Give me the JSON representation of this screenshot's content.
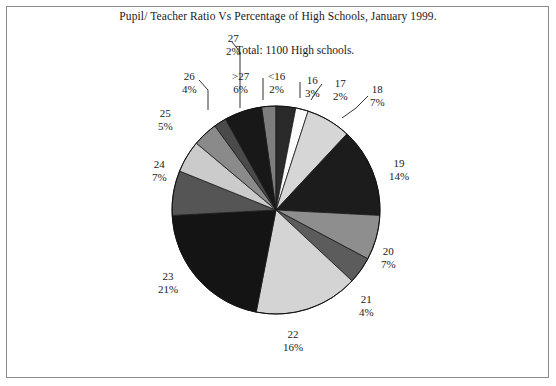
{
  "chart_data": {
    "type": "pie",
    "title": "Pupil/ Teacher Ratio Vs Percentage of High Schools, January 1999.",
    "subtitle": "Total: 1100 High schools.",
    "xlabel": "",
    "ylabel": "",
    "legend": "none",
    "grid": false,
    "total_label": "1100 High schools",
    "categories": [
      "<16",
      "16",
      "17",
      "18",
      "19",
      "20",
      "21",
      "22",
      "23",
      "24",
      "25",
      "26",
      "27",
      ">27"
    ],
    "values": [
      2,
      3,
      2,
      7,
      14,
      7,
      4,
      16,
      21,
      7,
      5,
      4,
      2,
      6
    ],
    "unit": "%",
    "slices": [
      {
        "cat": "<16",
        "pct": "2%",
        "value": 2,
        "color": "#7d7d7d",
        "start": -8,
        "end": 0
      },
      {
        "cat": "16",
        "pct": "3%",
        "value": 3,
        "color": "#2a2a2a",
        "start": 0,
        "end": 11
      },
      {
        "cat": "17",
        "pct": "2%",
        "value": 2,
        "color": "#fbfbfb",
        "start": 11,
        "end": 18
      },
      {
        "cat": "18",
        "pct": "7%",
        "value": 7,
        "color": "#d6d6d6",
        "start": 18,
        "end": 43
      },
      {
        "cat": "19",
        "pct": "14%",
        "value": 14,
        "color": "#1c1c1c",
        "start": 43,
        "end": 93
      },
      {
        "cat": "20",
        "pct": "7%",
        "value": 7,
        "color": "#8e8e8e",
        "start": 93,
        "end": 118
      },
      {
        "cat": "21",
        "pct": "4%",
        "value": 4,
        "color": "#5c5c5c",
        "start": 118,
        "end": 133
      },
      {
        "cat": "22",
        "pct": "16%",
        "value": 16,
        "color": "#d4d4d4",
        "start": 133,
        "end": 191
      },
      {
        "cat": "23",
        "pct": "21%",
        "value": 21,
        "color": "#141414",
        "start": 191,
        "end": 267
      },
      {
        "cat": "24",
        "pct": "7%",
        "value": 7,
        "color": "#555555",
        "start": 267,
        "end": 292
      },
      {
        "cat": "25",
        "pct": "5%",
        "value": 5,
        "color": "#cbcbcb",
        "start": 292,
        "end": 310
      },
      {
        "cat": "26",
        "pct": "4%",
        "value": 4,
        "color": "#8a8a8a",
        "start": 310,
        "end": 324
      },
      {
        "cat": "27",
        "pct": "2%",
        "value": 2,
        "color": "#4a4a4a",
        "start": 324,
        "end": 331
      },
      {
        "cat": ">27",
        "pct": "6%",
        "value": 6,
        "color": "#181818",
        "start": 331,
        "end": 352
      }
    ]
  },
  "labels": [
    {
      "name": "label-27",
      "cat": "27",
      "pct": "2%",
      "left": 226,
      "top": 32
    },
    {
      "name": "label-26",
      "cat": "26",
      "pct": "4%",
      "left": 182,
      "top": 70
    },
    {
      "name": "label-25",
      "cat": "25",
      "pct": "5%",
      "left": 158,
      "top": 107
    },
    {
      "name": "label-24",
      "cat": "24",
      "pct": "7%",
      "left": 152,
      "top": 158
    },
    {
      "name": "label-23",
      "cat": "23",
      "pct": "21%",
      "left": 158,
      "top": 270
    },
    {
      "name": "label-22",
      "cat": "22",
      "pct": "16%",
      "left": 283,
      "top": 328
    },
    {
      "name": "label-21",
      "cat": "21",
      "pct": "4%",
      "left": 359,
      "top": 293
    },
    {
      "name": "label-20",
      "cat": "20",
      "pct": "7%",
      "left": 381,
      "top": 245
    },
    {
      "name": "label-19",
      "cat": "19",
      "pct": "14%",
      "left": 389,
      "top": 157
    },
    {
      "name": "label-18",
      "cat": "18",
      "pct": "7%",
      "left": 370,
      "top": 83
    },
    {
      "name": "label-17",
      "cat": "17",
      "pct": "2%",
      "left": 333,
      "top": 77
    },
    {
      "name": "label-16",
      "cat": "16",
      "pct": "3%",
      "left": 305,
      "top": 74
    },
    {
      "name": "label-lt16",
      "cat": "<16",
      "pct": "2%",
      "left": 268,
      "top": 70
    },
    {
      "name": "label-gt27",
      "cat": ">27",
      "pct": "6%",
      "left": 232,
      "top": 70
    }
  ]
}
